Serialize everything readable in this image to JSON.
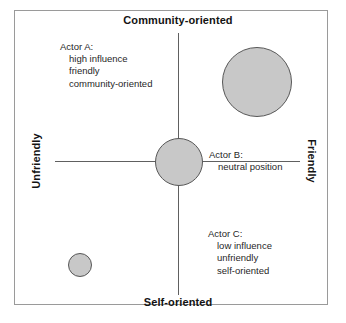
{
  "chart_data": {
    "type": "scatter",
    "title": "",
    "xlabel": "Unfriendly – Friendly",
    "ylabel": "Self-oriented – Community-oriented",
    "xlim": [
      -1,
      1
    ],
    "ylim": [
      -1,
      1
    ],
    "grid": false,
    "legend": "none",
    "axis_labels": {
      "top": "Community-oriented",
      "bottom": "Self-oriented",
      "left": "Unfriendly",
      "right": "Friendly"
    },
    "series": [
      {
        "name": "Actor A",
        "x": 0.64,
        "y": 0.6,
        "size": 70,
        "attributes": [
          "high influence",
          "friendly",
          "community-oriented"
        ]
      },
      {
        "name": "Actor B",
        "x": 0.0,
        "y": 0.0,
        "size": 48,
        "attributes": [
          "neutral position"
        ]
      },
      {
        "name": "Actor C",
        "x": -0.81,
        "y": -0.79,
        "size": 24,
        "attributes": [
          "low influence",
          "unfriendly",
          "self-oriented"
        ]
      }
    ],
    "bubble_fill_color": "#c8c8c8",
    "bubble_stroke_color": "#575757",
    "axis_color": "#606060"
  },
  "axes": {
    "top_label": "Community-oriented",
    "bottom_label": "Self-oriented",
    "left_label": "Unfriendly",
    "right_label": "Friendly"
  },
  "annotations": {
    "actor_a": {
      "title": "Actor A:",
      "line1": "high influence",
      "line2": "friendly",
      "line3": "community-oriented"
    },
    "actor_b": {
      "title": "Actor  B:",
      "line1": "neutral position"
    },
    "actor_c": {
      "title": "Actor C:",
      "line1": "low influence",
      "line2": "unfriendly",
      "line3": "self-oriented"
    }
  }
}
